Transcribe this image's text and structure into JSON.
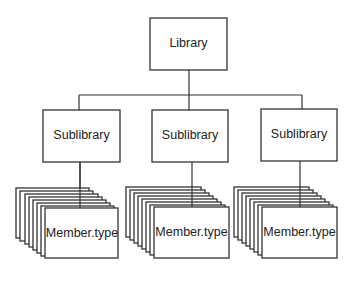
{
  "diagram": {
    "type": "hierarchy",
    "root": {
      "label": "Library"
    },
    "children": [
      {
        "label": "Sublibrary",
        "member": {
          "label": "Member.type",
          "stack_count": 7
        }
      },
      {
        "label": "Sublibrary",
        "member": {
          "label": "Member.type",
          "stack_count": 7
        }
      },
      {
        "label": "Sublibrary",
        "member": {
          "label": "Member.type",
          "stack_count": 7
        }
      }
    ]
  }
}
